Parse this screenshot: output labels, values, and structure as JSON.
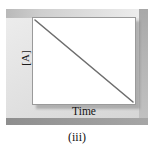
{
  "figure": {
    "caption": "(iii)",
    "panel_bg_color": "#dcdcdc",
    "plot_bg_color": "#ffffff",
    "line_color": "#6e6e6e",
    "border_color": "#9a9a9a"
  },
  "axes": {
    "y_label": "[A]",
    "x_label": "Time"
  },
  "chart_data": {
    "type": "line",
    "title": "",
    "subtitle": "",
    "xlabel": "Time",
    "ylabel": "[A]",
    "xlim": [
      0,
      1
    ],
    "ylim": [
      0,
      1
    ],
    "grid": false,
    "legend": "none",
    "annotations": [],
    "xticklabels": [],
    "yticklabels": [],
    "series": [
      {
        "name": "[A] vs Time",
        "x": [
          0,
          1
        ],
        "y": [
          1,
          0
        ],
        "color": "#6e6e6e",
        "style": "straight-descending-line"
      }
    ]
  }
}
